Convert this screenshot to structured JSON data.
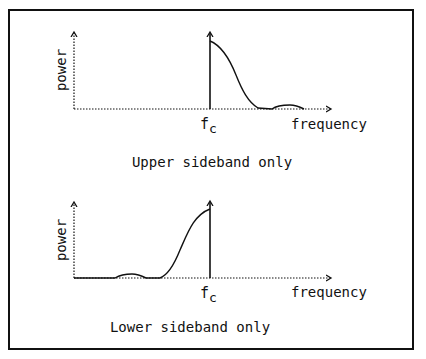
{
  "panels": [
    {
      "id": "upper",
      "ylabel": "power",
      "xlabel": "frequency",
      "fc_label_main": "f",
      "fc_label_sub": "c",
      "caption": "Upper sideband only"
    },
    {
      "id": "lower",
      "ylabel": "power",
      "xlabel": "frequency",
      "fc_label_main": "f",
      "fc_label_sub": "c",
      "caption": "Lower sideband only"
    }
  ],
  "colors": {
    "line": "#111111",
    "background": "#ffffff"
  }
}
